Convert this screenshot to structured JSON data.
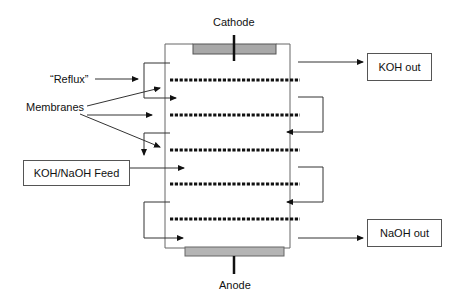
{
  "diagram": {
    "type": "electrodialysis cell schematic",
    "labels": {
      "cathode": "Cathode",
      "anode": "Anode",
      "reflux": "“Reflux”",
      "membranes": "Membranes"
    },
    "boxes": {
      "feed": "KOH/NaOH Feed",
      "koh_out": "KOH out",
      "naoh_out": "NaOH out"
    },
    "membrane_count": 5,
    "colors": {
      "line": "#333333",
      "electrode_fill": "#a8a8a8",
      "membrane": "#111111"
    }
  }
}
